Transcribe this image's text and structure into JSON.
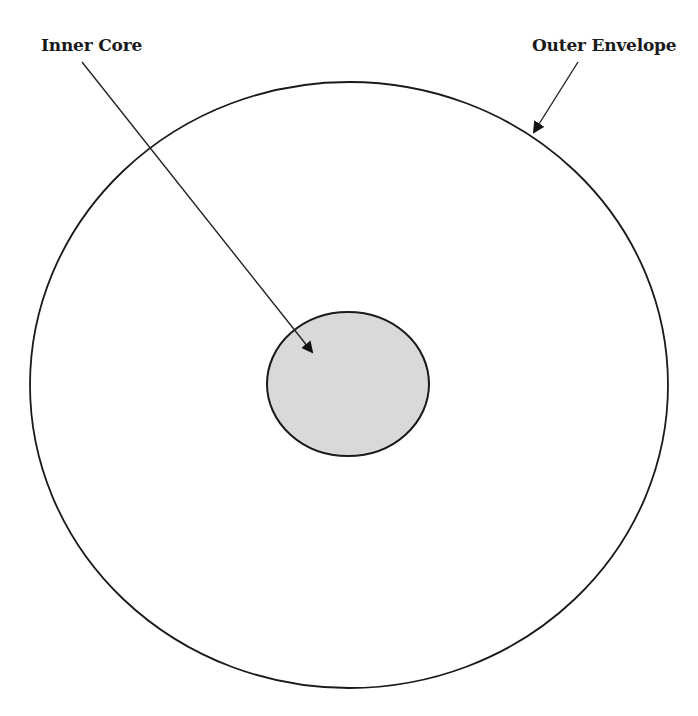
{
  "diagram": {
    "type": "concentric-circles",
    "labels": {
      "inner": "Inner Core",
      "outer": "Outer Envelope"
    },
    "colors": {
      "background": "#ffffff",
      "stroke": "#1a1a1a",
      "inner_fill": "#d9d9d9",
      "outer_fill": "#ffffff"
    },
    "shapes": {
      "outer_ellipse": {
        "cx": 349,
        "cy": 385,
        "rx": 319,
        "ry": 303
      },
      "inner_ellipse": {
        "cx": 348,
        "cy": 384,
        "rx": 81,
        "ry": 72
      }
    },
    "arrows": [
      {
        "name": "inner-core-arrow",
        "from": [
          82,
          62
        ],
        "to": [
          312,
          352
        ]
      },
      {
        "name": "outer-envelope-arrow",
        "from": [
          578,
          62
        ],
        "to": [
          534,
          132
        ]
      }
    ]
  }
}
